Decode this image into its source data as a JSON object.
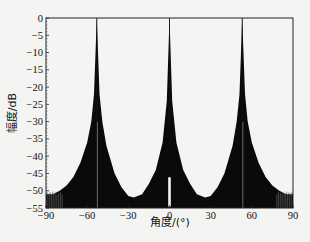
{
  "chart_data": {
    "type": "line",
    "title": "",
    "xlabel": "角度/(°)",
    "ylabel": "幅度/dB",
    "xlim": [
      -90,
      90
    ],
    "ylim": [
      -55,
      0
    ],
    "xticks": [
      -90,
      -60,
      -30,
      0,
      30,
      60,
      90
    ],
    "yticks": [
      0,
      -5,
      -10,
      -15,
      -20,
      -25,
      -30,
      -35,
      -40,
      -45,
      -50,
      -55
    ],
    "grid": false,
    "legend": null,
    "series": [
      {
        "name": "array pattern (filled, dense sidelobes)",
        "main_lobes_deg": [
          -53,
          0,
          53
        ],
        "main_lobe_peak_db": 0,
        "envelope_x": [
          -90,
          -85,
          -80,
          -75,
          -70,
          -65,
          -60,
          -57,
          -55,
          -53,
          -51,
          -49,
          -46,
          -40,
          -35,
          -30,
          -26,
          -20,
          -15,
          -10,
          -5,
          -2,
          0,
          2,
          5,
          10,
          15,
          20,
          26,
          30,
          35,
          40,
          46,
          49,
          51,
          53,
          55,
          57,
          60,
          65,
          70,
          75,
          80,
          85,
          90
        ],
        "envelope_y": [
          -51,
          -51,
          -50,
          -48.5,
          -46,
          -42,
          -36,
          -30,
          -22,
          0,
          -22,
          -30,
          -37,
          -45,
          -49,
          -51.5,
          -52,
          -51,
          -48,
          -44,
          -36,
          -24,
          0,
          -24,
          -36,
          -44,
          -48,
          -51,
          -52,
          -51.5,
          -49,
          -45,
          -37,
          -30,
          -22,
          0,
          -22,
          -30,
          -36,
          -42,
          -46,
          -48.5,
          -50,
          -51,
          -51
        ],
        "notch_near_0_deg_from_db": -46
      }
    ],
    "annotations": []
  }
}
